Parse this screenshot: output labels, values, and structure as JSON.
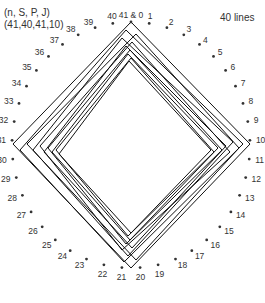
{
  "header": {
    "params_names": "(n, S, P, J)",
    "params_values": "(41,40,41,10)",
    "line_count_label": "40 lines"
  },
  "diagram": {
    "center": [
      131,
      145
    ],
    "radius_x": 119,
    "radius_y": 123,
    "point_count": 41,
    "top_label": "41 & 0",
    "point_color": "#333333",
    "line_color": "#111111",
    "points": [
      {
        "id": 0,
        "label": "41 & 0"
      },
      {
        "id": 1,
        "label": "1"
      },
      {
        "id": 2,
        "label": "2"
      },
      {
        "id": 3,
        "label": "3"
      },
      {
        "id": 4,
        "label": "4"
      },
      {
        "id": 5,
        "label": "5"
      },
      {
        "id": 6,
        "label": "6"
      },
      {
        "id": 7,
        "label": "7"
      },
      {
        "id": 8,
        "label": "8"
      },
      {
        "id": 9,
        "label": "9"
      },
      {
        "id": 10,
        "label": "10"
      },
      {
        "id": 11,
        "label": "11"
      },
      {
        "id": 12,
        "label": "12"
      },
      {
        "id": 13,
        "label": "13"
      },
      {
        "id": 14,
        "label": "14"
      },
      {
        "id": 15,
        "label": "15"
      },
      {
        "id": 16,
        "label": "16"
      },
      {
        "id": 17,
        "label": "17"
      },
      {
        "id": 18,
        "label": "18"
      },
      {
        "id": 19,
        "label": "19"
      },
      {
        "id": 20,
        "label": "20"
      },
      {
        "id": 21,
        "label": "21"
      },
      {
        "id": 22,
        "label": "22"
      },
      {
        "id": 23,
        "label": "23"
      },
      {
        "id": 24,
        "label": "24"
      },
      {
        "id": 25,
        "label": "25"
      },
      {
        "id": 26,
        "label": "26"
      },
      {
        "id": 27,
        "label": "27"
      },
      {
        "id": 28,
        "label": "28"
      },
      {
        "id": 29,
        "label": "29"
      },
      {
        "id": 30,
        "label": "30"
      },
      {
        "id": 31,
        "label": "31"
      },
      {
        "id": 32,
        "label": "32"
      },
      {
        "id": 33,
        "label": "33"
      },
      {
        "id": 34,
        "label": "34"
      },
      {
        "id": 35,
        "label": "35"
      },
      {
        "id": 36,
        "label": "36"
      },
      {
        "id": 37,
        "label": "37"
      },
      {
        "id": 38,
        "label": "38"
      },
      {
        "id": 39,
        "label": "39"
      },
      {
        "id": 40,
        "label": "40"
      }
    ],
    "diamonds": [
      {
        "top": [
          131,
          22
        ],
        "right": [
          250,
          144
        ],
        "bottom": [
          131,
          268
        ],
        "left": [
          13,
          144
        ]
      },
      {
        "top": [
          126,
          30
        ],
        "right": [
          243,
          144
        ],
        "bottom": [
          124,
          262
        ],
        "left": [
          20,
          150
        ]
      },
      {
        "top": [
          136,
          34
        ],
        "right": [
          239,
          148
        ],
        "bottom": [
          136,
          260
        ],
        "left": [
          27,
          144
        ]
      },
      {
        "top": [
          122,
          38
        ],
        "right": [
          233,
          142
        ],
        "bottom": [
          128,
          256
        ],
        "left": [
          33,
          150
        ]
      },
      {
        "top": [
          132,
          42
        ],
        "right": [
          230,
          152
        ],
        "bottom": [
          122,
          250
        ],
        "left": [
          40,
          146
        ]
      },
      {
        "top": [
          126,
          46
        ],
        "right": [
          226,
          146
        ],
        "bottom": [
          132,
          248
        ],
        "left": [
          44,
          152
        ]
      },
      {
        "top": [
          130,
          50
        ],
        "right": [
          222,
          150
        ],
        "bottom": [
          126,
          244
        ],
        "left": [
          48,
          148
        ]
      },
      {
        "top": [
          128,
          54
        ],
        "right": [
          218,
          148
        ],
        "bottom": [
          130,
          240
        ],
        "left": [
          52,
          152
        ]
      },
      {
        "top": [
          131,
          58
        ],
        "right": [
          214,
          152
        ],
        "bottom": [
          128,
          236
        ],
        "left": [
          56,
          150
        ]
      },
      {
        "top": [
          129,
          61
        ],
        "right": [
          211,
          150
        ],
        "bottom": [
          131,
          233
        ],
        "left": [
          59,
          154
        ]
      }
    ]
  }
}
